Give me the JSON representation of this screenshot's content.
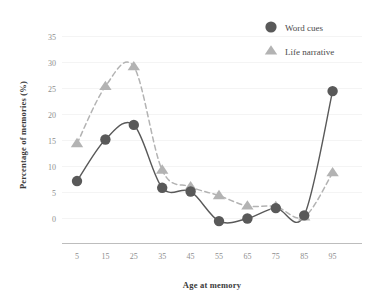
{
  "chart_data": {
    "type": "line",
    "title": "",
    "xlabel": "Age at memory",
    "ylabel": "Percentage of memories (%)",
    "x": [
      5,
      15,
      25,
      35,
      45,
      55,
      65,
      75,
      85,
      95
    ],
    "xticklabels": [
      "5",
      "15",
      "25",
      "35",
      "45",
      "55",
      "65",
      "75",
      "85",
      "95"
    ],
    "yticklabels": [
      "0",
      "5",
      "10",
      "15",
      "20",
      "25",
      "30",
      "35"
    ],
    "yticks": [
      0,
      5,
      10,
      15,
      20,
      25,
      30,
      35
    ],
    "xlim": [
      0,
      100
    ],
    "ylim": [
      -3,
      36
    ],
    "grid": true,
    "grid_axis": "y",
    "legend_position": "top-right",
    "smoothing": "spline",
    "series": [
      {
        "name": "Word cues",
        "marker": "circle",
        "color": "#595959",
        "linestyle": "solid",
        "values": [
          7.2,
          15.2,
          18.0,
          5.9,
          5.2,
          -0.5,
          0.0,
          2.0,
          0.6,
          24.5
        ]
      },
      {
        "name": "Life narrative",
        "marker": "triangle",
        "color": "#b3b3b3",
        "linestyle": "dashed",
        "values": [
          14.4,
          25.4,
          29.2,
          9.3,
          6.1,
          4.4,
          2.4,
          2.3,
          0.3,
          8.8
        ]
      }
    ]
  },
  "legend": {
    "items": [
      {
        "label": "Word cues",
        "marker": "circle",
        "color": "#595959"
      },
      {
        "label": "Life narrative",
        "marker": "triangle",
        "color": "#b3b3b3"
      }
    ]
  },
  "colors": {
    "background": "#ffffff",
    "grid": "#f4f4f4",
    "axis": "#bdbdbd",
    "tick_text": "#8e8e8e",
    "title_text": "#3a3a3a",
    "word_cues": "#595959",
    "life_narrative": "#b3b3b3"
  }
}
